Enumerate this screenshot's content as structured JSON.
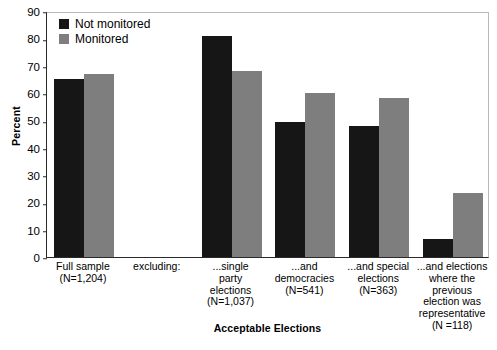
{
  "chart_data": {
    "type": "bar",
    "title": "",
    "xlabel": "Acceptable Elections",
    "ylabel": "Percent",
    "ylim": [
      0,
      90
    ],
    "ytick_step": 10,
    "yticks": [
      0,
      10,
      20,
      30,
      40,
      50,
      60,
      70,
      80,
      90
    ],
    "grid": false,
    "legend_position": "top-left",
    "categories": [
      "Full sample (N=1,204)",
      "excluding:",
      "...single party elections (N=1,037)",
      "...and democracies (N=541)",
      "...and special elections (N=363)",
      "...and elections where the previous election was representative (N =118)"
    ],
    "category_lines": [
      [
        "Full sample",
        "(N=1,204)"
      ],
      [
        "excluding:"
      ],
      [
        "...single",
        "party",
        "elections",
        "(N=1,037)"
      ],
      [
        "...and",
        "democracies",
        "(N=541)"
      ],
      [
        "...and special",
        "elections",
        "(N=363)"
      ],
      [
        "...and elections",
        "where the",
        "previous",
        "election was",
        "representative",
        "(N =118)"
      ]
    ],
    "series": [
      {
        "name": "Not monitored",
        "color": "#161616",
        "values": [
          65,
          null,
          81,
          49.5,
          48,
          6.5
        ]
      },
      {
        "name": "Monitored",
        "color": "#7e7e7e",
        "values": [
          67,
          null,
          68,
          60,
          58,
          23.5
        ]
      }
    ]
  },
  "legend": {
    "items": [
      {
        "label": "Not monitored",
        "color": "#161616"
      },
      {
        "label": "Monitored",
        "color": "#7e7e7e"
      }
    ]
  },
  "axes": {
    "y_title": "Percent",
    "x_title": "Acceptable Elections",
    "y_tick_labels": [
      "90",
      "80",
      "70",
      "60",
      "50",
      "40",
      "30",
      "20",
      "10",
      "0"
    ]
  },
  "colors": {
    "not_monitored": "#161616",
    "monitored": "#7e7e7e",
    "axis": "#2a2a2a",
    "frame": "#b9b9b9",
    "background": "#ffffff"
  }
}
